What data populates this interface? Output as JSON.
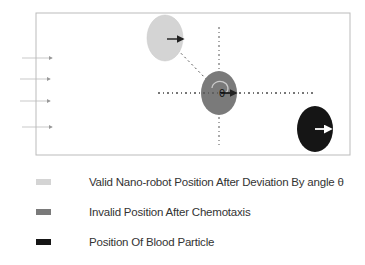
{
  "diagram": {
    "center_label": "θ",
    "nodes": [
      {
        "id": "valid",
        "color": "#d4d4d4",
        "cx": 165,
        "cy": 38,
        "rx": 18,
        "ry": 23
      },
      {
        "id": "invalid",
        "color": "#7a7a7a",
        "cx": 219,
        "cy": 93,
        "rx": 18,
        "ry": 22
      },
      {
        "id": "blood",
        "color": "#151515",
        "cx": 315,
        "cy": 129,
        "rx": 18,
        "ry": 23
      }
    ],
    "flow_arrows_count": 4
  },
  "legend": {
    "items": [
      {
        "label": "Valid Nano-robot Position After Deviation By angle θ",
        "color": "#d4d4d4"
      },
      {
        "label": "Invalid Position After Chemotaxis",
        "color": "#7a7a7a"
      },
      {
        "label": "Position Of Blood Particle",
        "color": "#151515"
      }
    ]
  }
}
